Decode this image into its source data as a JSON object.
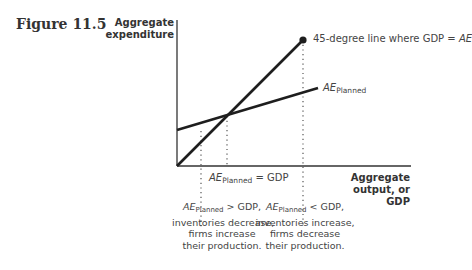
{
  "figure": {
    "label": "Figure 11.5"
  },
  "axes": {
    "y_label_line1": "Aggregate",
    "y_label_line2": "expenditure",
    "x_label_line1": "Aggregate",
    "x_label_line2": "output, or GDP"
  },
  "lines": {
    "forty_five": {
      "label_prefix": "45-degree line where GDP = ",
      "label_italic": "AE"
    },
    "ae_planned": {
      "label_main": "AE",
      "label_sub": "Planned"
    }
  },
  "annotations": {
    "equilibrium": {
      "main": "AE",
      "sub": "Planned",
      "rest": " = GDP"
    },
    "left_note": {
      "main": "AE",
      "sub": "Planned",
      "rest": " > GDP,",
      "line2": "inventories decrease,",
      "line3": "firms increase",
      "line4": "their production."
    },
    "right_note": {
      "main": "AE",
      "sub": "Planned",
      "rest": " < GDP,",
      "line2": "inventories increase,",
      "line3": "firms decrease",
      "line4": "their production."
    }
  },
  "colors": {
    "line": "#1e1e1e",
    "axis": "#333333",
    "dots": "#555555"
  }
}
